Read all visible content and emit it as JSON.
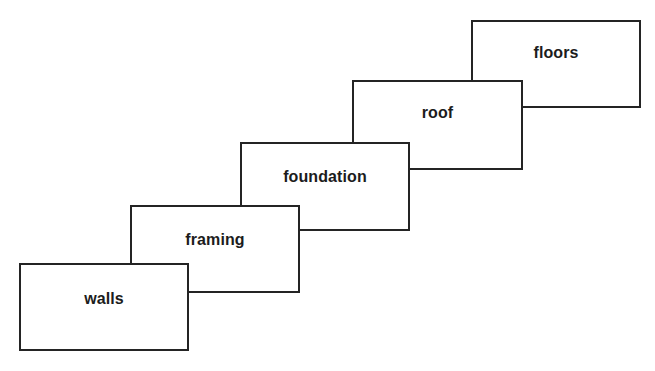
{
  "diagram": {
    "type": "staircase-overlapping-boxes",
    "background_color": "#ffffff",
    "line_color": "#242424",
    "text_color": "#1c1c1c",
    "nodes": [
      {
        "label": "walls",
        "order": 1
      },
      {
        "label": "framing",
        "order": 2
      },
      {
        "label": "foundation",
        "order": 3
      },
      {
        "label": "roof",
        "order": 4
      },
      {
        "label": "floors",
        "order": 5
      }
    ]
  }
}
